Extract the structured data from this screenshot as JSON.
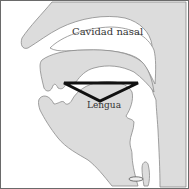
{
  "diagram": {
    "type": "vocal tract sagittal section",
    "labels": {
      "nasal_cavity": "Cavidad nasal",
      "tongue": "Lengua"
    },
    "overlay": {
      "shape": "triangle",
      "color": "#111111"
    },
    "colors": {
      "tissue_fill": "#dcdcdc",
      "tissue_stroke": "#8a8a8a",
      "background": "#ffffff",
      "frame": "#6a6a6a"
    }
  }
}
